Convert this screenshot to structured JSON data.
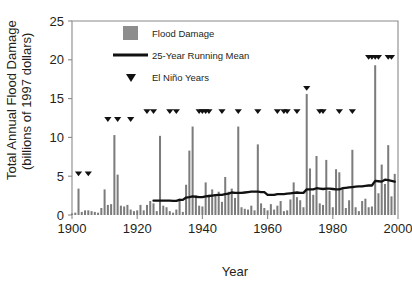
{
  "chart_data": {
    "type": "bar",
    "title": "",
    "xlabel": "Year",
    "ylabel": "Total Annual Flood Damage (billions of 1997 dollars)",
    "ylabel_line1": "Total Annual Flood Damage",
    "ylabel_line2": "(billions of 1997 dollars)",
    "xlim": [
      1900,
      2000
    ],
    "ylim": [
      0,
      25
    ],
    "yticks": [
      0,
      5,
      10,
      15,
      20,
      25
    ],
    "ytick_labels": [
      "0",
      "5",
      "10",
      "15",
      "20",
      "25"
    ],
    "xticks": [
      1900,
      1920,
      1940,
      1960,
      1980,
      2000
    ],
    "xtick_labels": [
      "1900",
      "1920",
      "1940",
      "1960",
      "1980",
      "2000"
    ],
    "grid": false,
    "legend_position": "top-center",
    "legend": [
      {
        "label": "Flood Damage",
        "marker": "square-swatch",
        "color": "#8d8d8d"
      },
      {
        "label": "25-Year Running Mean",
        "marker": "line",
        "color": "#111111"
      },
      {
        "label": "El Niño Years",
        "marker": "triangle-down",
        "color": "#111111"
      }
    ],
    "series": [
      {
        "name": "Flood Damage",
        "type": "bar",
        "color": "#7c7c7c",
        "x": [
          1900,
          1901,
          1902,
          1903,
          1904,
          1905,
          1906,
          1907,
          1908,
          1909,
          1910,
          1911,
          1912,
          1913,
          1914,
          1915,
          1916,
          1917,
          1918,
          1919,
          1920,
          1921,
          1922,
          1923,
          1924,
          1925,
          1926,
          1927,
          1928,
          1929,
          1930,
          1931,
          1932,
          1933,
          1934,
          1935,
          1936,
          1937,
          1938,
          1939,
          1940,
          1941,
          1942,
          1943,
          1944,
          1945,
          1946,
          1947,
          1948,
          1949,
          1950,
          1951,
          1952,
          1953,
          1954,
          1955,
          1956,
          1957,
          1958,
          1959,
          1960,
          1961,
          1962,
          1963,
          1964,
          1965,
          1966,
          1967,
          1968,
          1969,
          1970,
          1971,
          1972,
          1973,
          1974,
          1975,
          1976,
          1977,
          1978,
          1979,
          1980,
          1981,
          1982,
          1983,
          1984,
          1985,
          1986,
          1987,
          1988,
          1989,
          1990,
          1991,
          1992,
          1993,
          1994,
          1995,
          1996,
          1997,
          1998,
          1999
        ],
        "values": [
          0.2,
          0.3,
          3.4,
          0.4,
          0.6,
          0.6,
          0.5,
          0.4,
          0.3,
          0.9,
          3.3,
          1.3,
          1.4,
          10.3,
          5.2,
          1.2,
          1.1,
          1.3,
          0.7,
          0.5,
          0.6,
          1.3,
          0.6,
          1.3,
          1.8,
          1.5,
          0.5,
          10.2,
          1.2,
          1.0,
          0.5,
          0.3,
          0.7,
          2.1,
          0.4,
          3.9,
          8.3,
          11.4,
          2.5,
          1.2,
          1.1,
          4.2,
          2.6,
          3.3,
          2.7,
          3.0,
          1.7,
          4.9,
          3.0,
          3.4,
          2.2,
          11.4,
          1.0,
          0.8,
          0.7,
          1.2,
          0.6,
          9.1,
          1.5,
          0.9,
          0.6,
          1.4,
          0.7,
          1.2,
          1.8,
          0.5,
          0.6,
          2.0,
          4.2,
          2.3,
          1.9,
          1.0,
          15.6,
          6.0,
          2.6,
          7.6,
          1.5,
          1.3,
          7.1,
          3.1,
          1.0,
          5.9,
          5.5,
          3.4,
          0.9,
          1.9,
          8.4,
          1.0,
          0.5,
          1.8,
          2.1,
          1.0,
          1.1,
          19.3,
          2.8,
          6.5,
          4.0,
          9.0,
          2.4,
          5.3
        ]
      },
      {
        "name": "25-Year Running Mean",
        "type": "line",
        "color": "#111111",
        "x": [
          1925,
          1926,
          1927,
          1928,
          1929,
          1930,
          1931,
          1932,
          1933,
          1934,
          1935,
          1936,
          1937,
          1938,
          1939,
          1940,
          1941,
          1942,
          1943,
          1944,
          1945,
          1946,
          1947,
          1948,
          1949,
          1950,
          1951,
          1952,
          1953,
          1954,
          1955,
          1956,
          1957,
          1958,
          1959,
          1960,
          1961,
          1962,
          1963,
          1964,
          1965,
          1966,
          1967,
          1968,
          1969,
          1970,
          1971,
          1972,
          1973,
          1974,
          1975,
          1976,
          1977,
          1978,
          1979,
          1980,
          1981,
          1982,
          1983,
          1984,
          1985,
          1986,
          1987,
          1988,
          1989,
          1990,
          1991,
          1992,
          1993,
          1994,
          1995,
          1996,
          1997,
          1998,
          1999
        ],
        "values": [
          1.85,
          1.85,
          1.85,
          1.85,
          1.86,
          1.85,
          1.82,
          1.82,
          1.95,
          1.95,
          2.25,
          2.3,
          2.4,
          2.35,
          2.3,
          2.3,
          2.4,
          2.45,
          2.5,
          2.55,
          2.6,
          2.6,
          2.7,
          2.75,
          2.9,
          2.85,
          2.85,
          2.85,
          2.9,
          2.95,
          3.0,
          3.0,
          3.0,
          2.95,
          2.95,
          2.6,
          2.6,
          2.6,
          2.7,
          2.7,
          2.7,
          2.75,
          2.8,
          2.85,
          2.9,
          2.85,
          2.85,
          3.3,
          3.3,
          3.3,
          3.45,
          3.4,
          3.35,
          3.4,
          3.4,
          3.35,
          3.3,
          3.3,
          3.45,
          3.5,
          3.55,
          3.6,
          3.65,
          3.7,
          3.7,
          3.75,
          3.8,
          3.8,
          4.4,
          4.35,
          4.3,
          4.55,
          4.5,
          4.4,
          4.3
        ]
      }
    ],
    "el_nino_years": [
      {
        "year": 1902,
        "level": 5
      },
      {
        "year": 1905,
        "level": 5
      },
      {
        "year": 1911,
        "level": 12
      },
      {
        "year": 1914,
        "level": 12
      },
      {
        "year": 1918,
        "level": 12
      },
      {
        "year": 1923,
        "level": 13
      },
      {
        "year": 1925,
        "level": 13
      },
      {
        "year": 1930,
        "level": 13
      },
      {
        "year": 1932,
        "level": 13
      },
      {
        "year": 1939,
        "level": 13
      },
      {
        "year": 1940,
        "level": 13
      },
      {
        "year": 1941,
        "level": 13
      },
      {
        "year": 1942,
        "level": 13
      },
      {
        "year": 1946,
        "level": 13
      },
      {
        "year": 1951,
        "level": 13
      },
      {
        "year": 1957,
        "level": 13
      },
      {
        "year": 1963,
        "level": 13
      },
      {
        "year": 1965,
        "level": 13
      },
      {
        "year": 1966,
        "level": 13
      },
      {
        "year": 1969,
        "level": 13
      },
      {
        "year": 1972,
        "level": 16
      },
      {
        "year": 1976,
        "level": 13
      },
      {
        "year": 1977,
        "level": 13
      },
      {
        "year": 1982,
        "level": 13
      },
      {
        "year": 1986,
        "level": 13
      },
      {
        "year": 1991,
        "level": 20
      },
      {
        "year": 1992,
        "level": 20
      },
      {
        "year": 1993,
        "level": 20
      },
      {
        "year": 1994,
        "level": 20
      },
      {
        "year": 1997,
        "level": 20
      },
      {
        "year": 1998,
        "level": 20
      }
    ]
  }
}
